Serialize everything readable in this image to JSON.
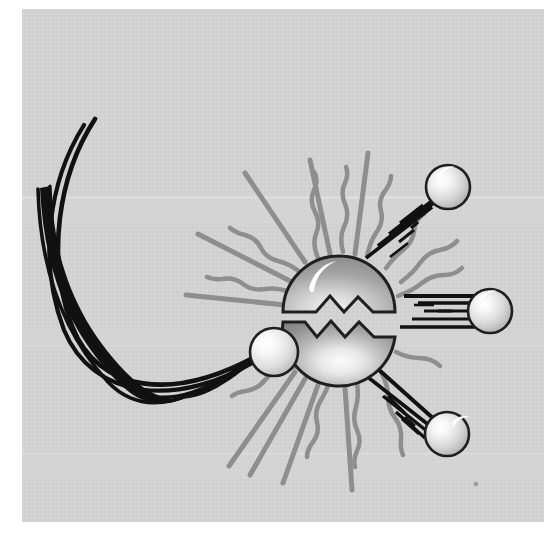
{
  "figure": {
    "title": "Nuclear fission of an atomic nucleus struck by a neutron",
    "style": "grayscale line art illustration on textured gray panel"
  },
  "canvas": {
    "width": 556,
    "height": 540,
    "outer_background": "#ffffff"
  },
  "panel": {
    "label": "illustration panel",
    "x": 22,
    "y": 9,
    "width": 522,
    "height": 513,
    "fill": "#d2d2d2",
    "texture": "fine halftone grain",
    "band_highlight_color": "#dcdcdc"
  },
  "palette": {
    "background_gray": "#d2d2d2",
    "ray_gray": "#8e8e8e",
    "trail_black": "#111111",
    "outline_black": "#1a1a1a",
    "nucleus_dark": "#8a8a8a",
    "nucleus_light": "#f2f2f2",
    "neutron_light": "#fbfbfb",
    "neutron_mid": "#c9c9c9",
    "highlight_white": "#ffffff"
  },
  "nucleus": {
    "label": "uranium nucleus splitting",
    "cx": 339,
    "cy": 318,
    "r": 56,
    "crack": "zigzag horizontal fracture separating upper and lower halves",
    "crack_gap": 9,
    "specular_highlight": "crescent highlight upper-left"
  },
  "incoming_neutron": {
    "label": "incoming neutron",
    "cx": 274,
    "cy": 352,
    "r": 24,
    "trail": "curved black streak arcing from upper-left down around to the nucleus",
    "trail_strand_count": 4,
    "direction": "from upper-left, curving clockwise to the right"
  },
  "ejected_neutrons": [
    {
      "label": "ejected neutron upper right",
      "cx": 448,
      "cy": 187,
      "r": 22,
      "trail_angle_deg": 214,
      "trail_length": 90,
      "trail_line_count": 7,
      "direction": "travelling up and to the right"
    },
    {
      "label": "ejected neutron middle right",
      "cx": 490,
      "cy": 311,
      "r": 22,
      "trail_angle_deg": 180,
      "trail_length": 92,
      "trail_line_count": 7,
      "direction": "travelling horizontally to the right"
    },
    {
      "label": "ejected neutron lower right",
      "cx": 447,
      "cy": 434,
      "r": 22,
      "trail_angle_deg": 145,
      "trail_length": 90,
      "trail_line_count": 7,
      "direction": "travelling down and to the right"
    }
  ],
  "energy_rays": {
    "label": "radiating energy rays emitted from the nucleus",
    "straight_count": 9,
    "wavy_count": 10,
    "color": "#8e8e8e",
    "inner_radius": 62,
    "outer_radius_straight": 140,
    "outer_radius_wavy": 120,
    "straight_angles_deg": [
      256,
      272,
      288,
      306,
      324,
      56,
      74,
      92,
      110
    ],
    "wavy_angles_deg": [
      264,
      280,
      296,
      312,
      332,
      348,
      10,
      48,
      66,
      84,
      102
    ],
    "description": "alternating straight and wavy gray lines fanning out in all directions except where neutrons exit"
  },
  "annotations": {
    "process": "fission",
    "visible_text": ""
  }
}
